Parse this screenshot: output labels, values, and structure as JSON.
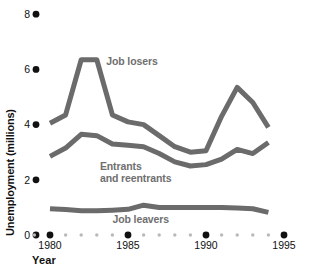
{
  "chart_data": {
    "type": "line",
    "title": "",
    "xlabel": "Year",
    "ylabel": "Unemployment (millions)",
    "xlim": [
      1979.0,
      1995.5
    ],
    "ylim": [
      0,
      8
    ],
    "grid": false,
    "legend_position": "inline-annotations",
    "x_major_ticks": [
      1980,
      1985,
      1990,
      1995
    ],
    "x_tick_labels": [
      "1980",
      "1985",
      "1990",
      "1995"
    ],
    "x_minor_ticks": [
      1979,
      1981,
      1982,
      1983,
      1984,
      1986,
      1987,
      1988,
      1989,
      1991,
      1992,
      1993,
      1994
    ],
    "y_ticks": [
      0,
      2,
      4,
      6,
      8
    ],
    "y_tick_labels": [
      "0",
      "2",
      "4",
      "6",
      "8"
    ],
    "x": [
      1980,
      1981,
      1982,
      1983,
      1984,
      1985,
      1986,
      1987,
      1988,
      1989,
      1990,
      1991,
      1992,
      1993,
      1994
    ],
    "series": [
      {
        "name": "Job losers",
        "color": "#6b6b6b",
        "values": [
          4.05,
          4.35,
          6.35,
          6.35,
          4.35,
          4.1,
          4.0,
          3.6,
          3.2,
          3.0,
          3.05,
          4.3,
          5.35,
          4.8,
          3.9
        ],
        "label_text": "Job losers",
        "label_x": 1983.6,
        "label_y": 6.15
      },
      {
        "name": "Entrants and reentrants",
        "color": "#6b6b6b",
        "values": [
          2.85,
          3.15,
          3.65,
          3.6,
          3.3,
          3.25,
          3.2,
          2.95,
          2.65,
          2.5,
          2.55,
          2.75,
          3.1,
          2.95,
          3.35
        ],
        "label_text_line1": "Entrants",
        "label_text_line2": "and reentrants",
        "label_x": 1983.2,
        "label_y": 2.35
      },
      {
        "name": "Job leavers",
        "color": "#6b6b6b",
        "values": [
          0.95,
          0.92,
          0.88,
          0.88,
          0.9,
          0.93,
          1.08,
          1.0,
          1.0,
          1.0,
          1.0,
          1.0,
          0.98,
          0.95,
          0.82
        ],
        "label_text": "Job leavers",
        "label_x": 1984.0,
        "label_y": 0.45
      }
    ]
  },
  "axes": {
    "y_axis_title": "Unemployment (millions)",
    "x_axis_title": "Year"
  }
}
